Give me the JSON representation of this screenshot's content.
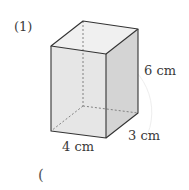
{
  "problem": {
    "number": "(1)",
    "answer_paren_open": "("
  },
  "figure": {
    "type": "rectangular prism",
    "dimensions": {
      "height": "6 cm",
      "depth": "3 cm",
      "width": "4 cm"
    }
  },
  "colors": {
    "edge": "#333333",
    "front_face": "#e6e6e6",
    "side_face": "#d2d2d2",
    "top_face": "#efefef",
    "hidden_edge": "#777777"
  }
}
